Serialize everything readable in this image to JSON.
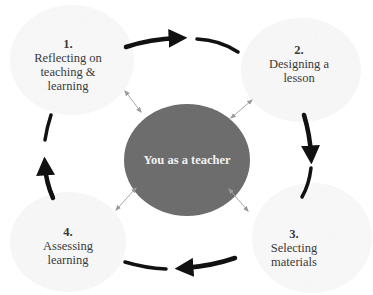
{
  "diagram": {
    "type": "cycle",
    "direction": "clockwise",
    "center": {
      "label": "You as a teacher",
      "fill": "#6d6d6d",
      "text_color": "#f2f2f2"
    },
    "stages": [
      {
        "number": "1.",
        "lines": [
          "Reflecting on",
          "teaching &",
          "learning"
        ]
      },
      {
        "number": "2.",
        "lines": [
          "Designing a",
          "lesson"
        ]
      },
      {
        "number": "3.",
        "lines": [
          "Selecting",
          "materials"
        ]
      },
      {
        "number": "4.",
        "lines": [
          "Assessing",
          "learning"
        ]
      }
    ],
    "colors": {
      "cycle_arrow": "#111111",
      "connector_arrow": "#a8a8a8",
      "stage_blob": "#f3f3f3",
      "stage_text": "#3a3a3a"
    },
    "connections": [
      {
        "from": "1",
        "to": "2",
        "style": "thick-curved-arrow"
      },
      {
        "from": "2",
        "to": "3",
        "style": "thick-curved-arrow"
      },
      {
        "from": "3",
        "to": "4",
        "style": "thick-curved-arrow"
      },
      {
        "from": "4",
        "to": "1",
        "style": "thick-curved-arrow"
      },
      {
        "from": "center",
        "to": "1",
        "style": "thin-double-arrow"
      },
      {
        "from": "center",
        "to": "2",
        "style": "thin-double-arrow"
      },
      {
        "from": "center",
        "to": "3",
        "style": "thin-double-arrow"
      },
      {
        "from": "center",
        "to": "4",
        "style": "thin-double-arrow"
      }
    ]
  }
}
